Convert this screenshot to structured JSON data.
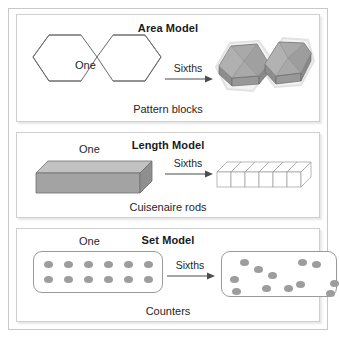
{
  "figure": {
    "title_hidden": "Fraction models for sixths",
    "background": "#ffffff",
    "frame_color": "#c8c8c8",
    "shape_stroke": "#6e6e6e",
    "fill_gray": "#a8a8a8",
    "fill_gray_light": "#bfbfbf",
    "fill_gray_dark": "#8f8f8f",
    "counter_color": "#9d9d9d"
  },
  "panels": [
    {
      "id": "area",
      "title": "Area Model",
      "caption": "Pattern blocks",
      "one_label": "One",
      "operation_label": "Sixths",
      "left_shape": "double-hexagon-outline",
      "right_shape": "two-hexagonal-prisms",
      "parts": 6
    },
    {
      "id": "length",
      "title": "Length Model",
      "caption": "Cuisenaire rods",
      "one_label": "One",
      "operation_label": "Sixths",
      "left_shape": "solid-gray-rod",
      "right_shape": "six-unit-cubes-rod",
      "parts": 6
    },
    {
      "id": "set",
      "title": "Set Model",
      "caption": "Counters",
      "one_label": "One",
      "operation_label": "Sixths",
      "left_shape": "twelve-counters-grid",
      "right_shape": "twelve-counters-grouped-in-pairs",
      "parts": 6,
      "counters_total": 12,
      "counters_per_group": 2
    }
  ],
  "set_model": {
    "grid_counters": [
      {
        "x": 10,
        "y": 9
      },
      {
        "x": 30,
        "y": 9
      },
      {
        "x": 50,
        "y": 9
      },
      {
        "x": 70,
        "y": 9
      },
      {
        "x": 90,
        "y": 9
      },
      {
        "x": 110,
        "y": 9
      },
      {
        "x": 10,
        "y": 24
      },
      {
        "x": 30,
        "y": 24
      },
      {
        "x": 50,
        "y": 24
      },
      {
        "x": 70,
        "y": 24
      },
      {
        "x": 90,
        "y": 24
      },
      {
        "x": 110,
        "y": 24
      }
    ],
    "scattered_counters": [
      {
        "x": 18,
        "y": 7
      },
      {
        "x": 32,
        "y": 14
      },
      {
        "x": 76,
        "y": 7
      },
      {
        "x": 90,
        "y": 9
      },
      {
        "x": 8,
        "y": 24
      },
      {
        "x": 10,
        "y": 36
      },
      {
        "x": 46,
        "y": 20
      },
      {
        "x": 40,
        "y": 33
      },
      {
        "x": 62,
        "y": 33
      },
      {
        "x": 74,
        "y": 29
      },
      {
        "x": 108,
        "y": 28
      },
      {
        "x": 104,
        "y": 38
      }
    ]
  }
}
